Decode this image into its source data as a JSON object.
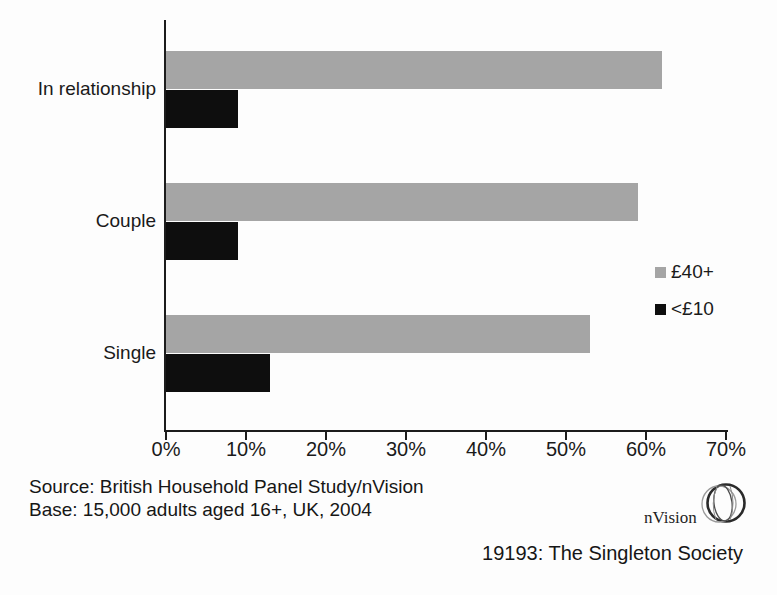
{
  "chart_data": {
    "type": "bar",
    "orientation": "horizontal",
    "title": "",
    "xlabel": "",
    "ylabel": "",
    "categories": [
      "In relationship",
      "Couple",
      "Single"
    ],
    "series": [
      {
        "name": "£40+",
        "color": "#a5a5a5",
        "values": [
          62,
          59,
          53
        ]
      },
      {
        "name": "<£10",
        "color": "#0e0e0e",
        "values": [
          9,
          9,
          13
        ]
      }
    ],
    "x_range": [
      0,
      70
    ],
    "x_tick_labels": [
      "0%",
      "10%",
      "20%",
      "30%",
      "40%",
      "50%",
      "60%",
      "70%"
    ],
    "grid": false,
    "legend_position": "right"
  },
  "legend": {
    "items": [
      {
        "label": "£40+",
        "color": "#a5a5a5"
      },
      {
        "label": "<£10",
        "color": "#0e0e0e"
      }
    ]
  },
  "footer": {
    "source_line": "Source: British Household Panel Study/nVision",
    "base_line": "Base: 15,000 adults aged 16+, UK, 2004",
    "caption": "19193: The Singleton Society"
  },
  "logo": {
    "text": "nVision",
    "icon": "globe-sketch-icon"
  },
  "colors": {
    "bar_gray": "#a5a5a5",
    "bar_black": "#0e0e0e",
    "axis": "#1c1c1c",
    "text": "#1a1a1a",
    "background": "#fdfdfd"
  }
}
